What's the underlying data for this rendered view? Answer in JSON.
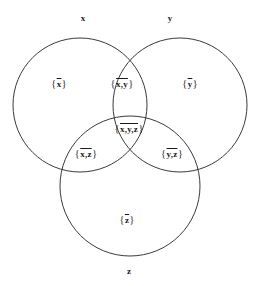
{
  "diagram": {
    "type": "venn-3-set",
    "stroke_color": "#3a3a3a",
    "background_color": "#ffffff",
    "text_color": "#1a1a1a",
    "circles": [
      {
        "id": "x",
        "name": "x",
        "cx": 80,
        "cy": 105,
        "r": 67,
        "name_x": 83,
        "name_y": 18
      },
      {
        "id": "y",
        "name": "y",
        "cx": 180,
        "cy": 105,
        "r": 67,
        "name_x": 170,
        "name_y": 18
      },
      {
        "id": "z",
        "name": "z",
        "cx": 130,
        "cy": 186,
        "r": 70,
        "name_x": 129,
        "name_y": 271
      }
    ],
    "regions": [
      {
        "id": "x-only",
        "open": "{",
        "items": "x",
        "close": "}",
        "x": 59,
        "y": 84
      },
      {
        "id": "x-y",
        "open": "{",
        "items": "x,y",
        "close": "}",
        "x": 122,
        "y": 84
      },
      {
        "id": "y-only",
        "open": "{",
        "items": "y",
        "close": "}",
        "x": 190,
        "y": 84
      },
      {
        "id": "x-y-z",
        "open": "{",
        "items": "x,y,z",
        "close": "}",
        "x": 129,
        "y": 129
      },
      {
        "id": "x-z",
        "open": "{",
        "items": "x,z",
        "close": "}",
        "x": 86,
        "y": 154
      },
      {
        "id": "y-z",
        "open": "{",
        "items": "y,z",
        "close": "}",
        "x": 172,
        "y": 154
      },
      {
        "id": "z-only",
        "open": "{",
        "items": "z",
        "close": "}",
        "x": 127,
        "y": 220
      }
    ]
  }
}
